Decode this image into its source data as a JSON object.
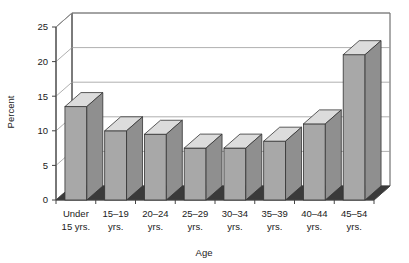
{
  "chart_data": {
    "type": "bar",
    "title": "",
    "xlabel": "Age",
    "ylabel": "Percent",
    "ylim": [
      0,
      25
    ],
    "yticks": [
      0,
      5,
      10,
      15,
      20,
      25
    ],
    "grid": true,
    "legend": false,
    "style": "3d-column",
    "categories": [
      "Under 15 yrs.",
      "15–19 yrs.",
      "20–24 yrs.",
      "25–29 yrs.",
      "30–34 yrs.",
      "35–39 yrs.",
      "40–44 yrs.",
      "45–54 yrs."
    ],
    "category_lines": [
      [
        "Under",
        "15 yrs."
      ],
      [
        "15–19",
        "yrs."
      ],
      [
        "20–24",
        "yrs."
      ],
      [
        "25–29",
        "yrs."
      ],
      [
        "30–34",
        "yrs."
      ],
      [
        "35–39",
        "yrs."
      ],
      [
        "40–44",
        "yrs."
      ],
      [
        "45–54",
        "yrs."
      ]
    ],
    "values": [
      13.5,
      10.0,
      9.5,
      7.5,
      7.5,
      8.5,
      11.0,
      21.0
    ]
  },
  "colors": {
    "bar_front": "#a8a8a8",
    "bar_top": "#dcdcdc",
    "bar_side": "#8f8f8f",
    "bar_outline": "#333333",
    "floor": "#3a3a3a",
    "wall": "#ffffff",
    "grid": "#9a9a9a",
    "axis": "#444444",
    "background": "#ffffff"
  },
  "axis": {
    "y_tick_labels": [
      "0",
      "5",
      "10",
      "15",
      "20",
      "25"
    ],
    "y_axis_title": "Percent",
    "x_axis_title": "Age"
  }
}
